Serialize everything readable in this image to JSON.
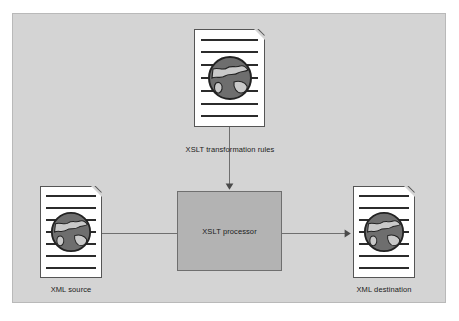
{
  "diagram": {
    "background_color": "#ffffff",
    "panel_color": "#d4d4d4",
    "panel_border_color": "#b9b9b9",
    "connector_color": "#6f6f6f",
    "document_fill": "#ffffff",
    "document_border": "#555555",
    "document_line_color": "#2b2b2b",
    "globe_ocean_color": "#6e6e6e",
    "globe_land_color": "#c9c9c9",
    "globe_outline_color": "#222222",
    "processor_fill": "#b3b3b3",
    "processor_border": "#6f6f6f",
    "text_color": "#1b1b1b"
  },
  "nodes": {
    "rules": {
      "label": "XSLT transformation rules",
      "icon": "xml-document-globe-icon",
      "line_count": 7
    },
    "source": {
      "label": "XML source",
      "icon": "xml-document-globe-icon",
      "line_count": 7
    },
    "destination": {
      "label": "XML destination",
      "icon": "xml-document-globe-icon",
      "line_count": 7
    },
    "processor": {
      "label": "XSLT processor",
      "shape": "rectangle"
    }
  },
  "connectors": [
    {
      "name": "rules-to-processor",
      "from": "rules",
      "to": "processor",
      "direction": "down",
      "arrowhead": "end"
    },
    {
      "name": "source-to-destination",
      "from": "source",
      "to": "destination",
      "direction": "right",
      "arrowhead": "end"
    }
  ]
}
